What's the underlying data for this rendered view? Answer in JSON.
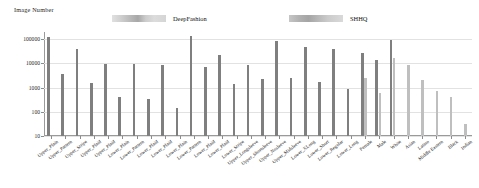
{
  "chart_data": {
    "type": "bar",
    "title": "",
    "subtitle": "",
    "ylabel": "Image Number",
    "xlabel": "",
    "yscale": "log",
    "ylim": [
      10,
      200000
    ],
    "grid": true,
    "legend_position": "top",
    "ytick_labels": [
      "10",
      "100",
      "1000",
      "10000",
      "100000"
    ],
    "ytick_values": [
      10,
      100,
      1000,
      10000,
      100000
    ],
    "categories": [
      "Upper_Plain",
      "Upper_Pattern",
      "Upper_Stripe",
      "Upper_Plaid",
      "Upper_Plaid",
      "Lower_Plain",
      "Lower_Pattern",
      "Lower_Plaid",
      "Lower_Plaid",
      "Lower_Plain",
      "Lower_Pattern",
      "Lower_Plaid",
      "Lower_Plaid",
      "Lower_Stripe",
      "Upper_Longsleeve",
      "Upper_Shortsleeve",
      "Upper_Nosleeve",
      "Upper_Midsleeve",
      "Lower_XLong",
      "Lower_Short",
      "Lower_Regular",
      "Lower_Long",
      "Female",
      "Male",
      "White",
      "Asian",
      "Latino",
      "Middle Eastern",
      "Black",
      "Indian"
    ],
    "series": [
      {
        "name": "DeepFashion",
        "color": "#7f7f7f",
        "values": [
          130000,
          3800,
          41000,
          1600,
          9200,
          420,
          9200,
          350,
          9000,
          150,
          140000,
          7000,
          22000,
          1400,
          8800,
          2300,
          85000,
          2400,
          50000,
          1700,
          41000,
          900,
          27000,
          14000,
          95000,
          null,
          null,
          null,
          null,
          null
        ]
      },
      {
        "name": "SHHQ",
        "color": "#bfbfbf",
        "values": [
          null,
          null,
          null,
          null,
          null,
          null,
          null,
          null,
          null,
          null,
          null,
          null,
          null,
          null,
          null,
          null,
          null,
          null,
          null,
          null,
          null,
          null,
          2600,
          600,
          17000,
          9000,
          2000,
          700,
          400,
          30
        ]
      }
    ],
    "bars": [
      {
        "category": "Upper_Plain",
        "deepfashion": 130000,
        "shhq": null
      },
      {
        "category": "Upper_Pattern",
        "deepfashion": 3800,
        "shhq": null
      },
      {
        "category": "Upper_Stripe",
        "deepfashion": 41000,
        "shhq": null
      },
      {
        "category": "Upper_Plaid",
        "deepfashion": 1600,
        "shhq": null
      },
      {
        "category": "Upper_Plaid",
        "deepfashion": 9200,
        "shhq": null
      },
      {
        "category": "Lower_Plain",
        "deepfashion": 420,
        "shhq": null
      },
      {
        "category": "Lower_Pattern",
        "deepfashion": 9200,
        "shhq": null
      },
      {
        "category": "Lower_Plaid",
        "deepfashion": 350,
        "shhq": null
      },
      {
        "category": "Lower_Plaid",
        "deepfashion": 9000,
        "shhq": null
      },
      {
        "category": "Lower_Plain",
        "deepfashion": 150,
        "shhq": null
      },
      {
        "category": "Lower_Pattern",
        "deepfashion": 140000,
        "shhq": null
      },
      {
        "category": "Lower_Plaid",
        "deepfashion": 7000,
        "shhq": null
      },
      {
        "category": "Lower_Plaid",
        "deepfashion": 22000,
        "shhq": null
      },
      {
        "category": "Lower_Stripe",
        "deepfashion": 1400,
        "shhq": null
      },
      {
        "category": "Upper_Longsleeve",
        "deepfashion": 8800,
        "shhq": null
      },
      {
        "category": "Upper_Shortsleeve",
        "deepfashion": 2300,
        "shhq": null
      },
      {
        "category": "Upper_Nosleeve",
        "deepfashion": 85000,
        "shhq": null
      },
      {
        "category": "Upper_Midsleeve",
        "deepfashion": 2400,
        "shhq": null
      },
      {
        "category": "Lower_XLong",
        "deepfashion": 50000,
        "shhq": null
      },
      {
        "category": "Lower_Short",
        "deepfashion": 1700,
        "shhq": null
      },
      {
        "category": "Lower_Regular",
        "deepfashion": 41000,
        "shhq": null
      },
      {
        "category": "Lower_Long",
        "deepfashion": 900,
        "shhq": null
      },
      {
        "category": "Female",
        "deepfashion": 27000,
        "shhq": 2600
      },
      {
        "category": "Male",
        "deepfashion": 14000,
        "shhq": 600
      },
      {
        "category": "White",
        "deepfashion": 95000,
        "shhq": 17000
      },
      {
        "category": "Asian",
        "deepfashion": null,
        "shhq": 9000
      },
      {
        "category": "Latino",
        "deepfashion": null,
        "shhq": 2000
      },
      {
        "category": "Middle Eastern",
        "deepfashion": null,
        "shhq": 700
      },
      {
        "category": "Black",
        "deepfashion": null,
        "shhq": 400
      },
      {
        "category": "Indian",
        "deepfashion": null,
        "shhq": 30
      }
    ]
  },
  "legend": {
    "entries": [
      {
        "label": "DeepFashion",
        "color": "#8a8a8a"
      },
      {
        "label": "SHHQ",
        "color": "#9a9a9a"
      }
    ]
  },
  "axis": {
    "y_title": "Image Number"
  }
}
